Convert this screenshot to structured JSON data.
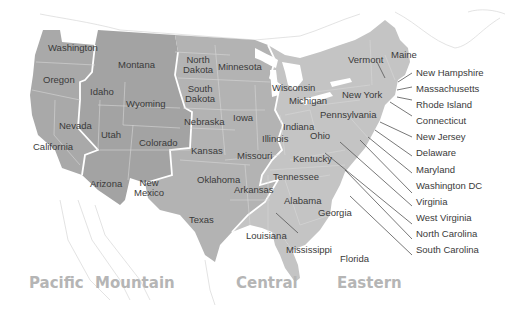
{
  "map": {
    "title": "US Time Zones",
    "colors": {
      "background": "#ffffff",
      "land_outline": "#d8d8d8",
      "pacific": "#a9a9a9",
      "mountain": "#a3a3a3",
      "central": "#b3b3b3",
      "eastern": "#c4c4c4",
      "zone_border": "#ffffff",
      "label": "#3a3a3a",
      "zone_label": "#b5b5b5"
    },
    "time_zones": [
      {
        "name": "Pacific"
      },
      {
        "name": "Mountain"
      },
      {
        "name": "Central"
      },
      {
        "name": "Eastern"
      }
    ],
    "states": {
      "washington": "Washington",
      "oregon": "Oregon",
      "california": "California",
      "nevada": "Nevada",
      "idaho": "Idaho",
      "montana": "Montana",
      "wyoming": "Wyoming",
      "utah": "Utah",
      "colorado": "Colorado",
      "arizona": "Arizona",
      "new_mexico_1": "New",
      "new_mexico_2": "Mexico",
      "north_dakota_1": "North",
      "north_dakota_2": "Dakota",
      "south_dakota_1": "South",
      "south_dakota_2": "Dakota",
      "nebraska": "Nebraska",
      "kansas": "Kansas",
      "oklahoma": "Oklahoma",
      "texas": "Texas",
      "minnesota": "Minnesota",
      "iowa": "Iowa",
      "missouri": "Missouri",
      "arkansas": "Arkansas",
      "louisiana": "Louisiana",
      "wisconsin": "Wisconsin",
      "illinois": "Illinois",
      "mississippi": "Mississippi",
      "alabama": "Alabama",
      "tennessee": "Tennessee",
      "kentucky": "Kentucky",
      "michigan": "Michigan",
      "indiana": "Indiana",
      "ohio": "Ohio",
      "georgia": "Georgia",
      "florida": "Florida",
      "pennsylvania": "Pennsylvania",
      "new_york": "New York",
      "vermont": "Vermont",
      "maine": "Maine"
    },
    "callouts": [
      "New Hampshire",
      "Massachusetts",
      "Rhode Island",
      "Connecticut",
      "New Jersey",
      "Delaware",
      "Maryland",
      "Washington DC",
      "Virginia",
      "West Virginia",
      "North Carolina",
      "South Carolina"
    ]
  }
}
